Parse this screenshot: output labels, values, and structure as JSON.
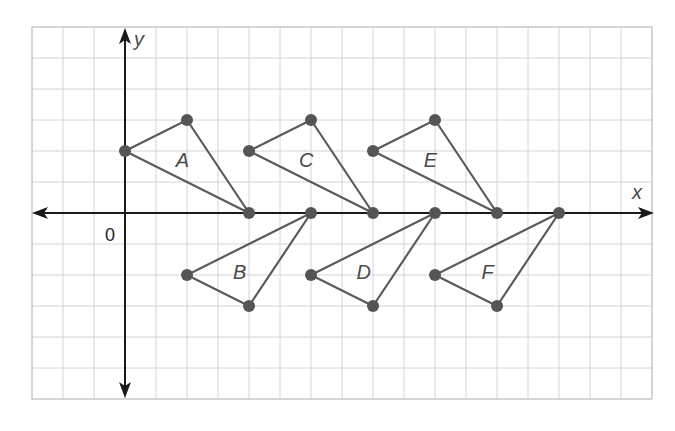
{
  "figure": {
    "x_axis_label": "x",
    "y_axis_label": "y",
    "origin_label": "0",
    "grid": {
      "x_min": -3,
      "x_max": 17,
      "y_min": -6,
      "y_max": 6,
      "unit_px": 31,
      "origin_px": [
        125,
        213
      ]
    },
    "colors": {
      "grid": "#d4d4d4",
      "axis": "#1a1a1a",
      "triangle": "#5a5a5a",
      "point": "#555555",
      "label": "#4a4a4a"
    },
    "triangles": [
      {
        "name": "A",
        "vertices": [
          [
            0,
            2
          ],
          [
            2,
            3
          ],
          [
            4,
            0
          ]
        ],
        "label_pos": [
          1.85,
          1.7
        ]
      },
      {
        "name": "B",
        "vertices": [
          [
            6,
            0
          ],
          [
            2,
            -2
          ],
          [
            4,
            -3
          ]
        ],
        "label_pos": [
          3.7,
          -1.9
        ]
      },
      {
        "name": "C",
        "vertices": [
          [
            4,
            2
          ],
          [
            6,
            3
          ],
          [
            8,
            0
          ]
        ],
        "label_pos": [
          5.85,
          1.7
        ]
      },
      {
        "name": "D",
        "vertices": [
          [
            10,
            0
          ],
          [
            6,
            -2
          ],
          [
            8,
            -3
          ]
        ],
        "label_pos": [
          7.7,
          -1.9
        ]
      },
      {
        "name": "E",
        "vertices": [
          [
            8,
            2
          ],
          [
            10,
            3
          ],
          [
            12,
            0
          ]
        ],
        "label_pos": [
          9.85,
          1.7
        ]
      },
      {
        "name": "F",
        "vertices": [
          [
            14,
            0
          ],
          [
            10,
            -2
          ],
          [
            12,
            -3
          ]
        ],
        "label_pos": [
          11.7,
          -1.9
        ]
      }
    ]
  }
}
